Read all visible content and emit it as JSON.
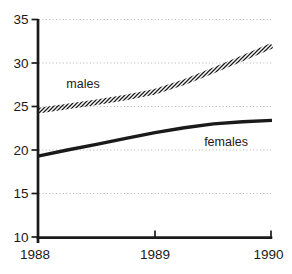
{
  "page": {
    "background": "#ffffff"
  },
  "chart_data": {
    "type": "line",
    "title": "",
    "xlabel": "",
    "ylabel": "",
    "xlim": [
      1988,
      1990
    ],
    "ylim": [
      10,
      35
    ],
    "grid": {
      "horizontal": true,
      "style": "dotted",
      "color": "#b2b2b2"
    },
    "axis_color": "#1a1a1a",
    "background": "#ffffff",
    "x_ticks": [
      {
        "value": 1988,
        "label": "1988"
      },
      {
        "value": 1989,
        "label": "1989"
      },
      {
        "value": 1990,
        "label": "1990"
      }
    ],
    "y_ticks": [
      {
        "value": 10,
        "label": "10"
      },
      {
        "value": 15,
        "label": "15"
      },
      {
        "value": 20,
        "label": "20"
      },
      {
        "value": 25,
        "label": "25"
      },
      {
        "value": 30,
        "label": "30"
      },
      {
        "value": 35,
        "label": "35"
      }
    ],
    "series": [
      {
        "name": "males",
        "label": "males",
        "style": "hatched-band",
        "color": "#1a1a1a",
        "label_anchor": {
          "year": 1988.385,
          "value": 27.1
        },
        "points": [
          [
            1988.0,
            24.5
          ],
          [
            1988.25,
            25.0
          ],
          [
            1988.5,
            25.5
          ],
          [
            1988.75,
            26.05
          ],
          [
            1989.0,
            26.7
          ],
          [
            1989.25,
            27.8
          ],
          [
            1989.5,
            29.15
          ],
          [
            1989.75,
            30.55
          ],
          [
            1990.0,
            32.0
          ]
        ],
        "key_values": {
          "1988": 24.5,
          "1989": 26.7,
          "1990": 32.0
        }
      },
      {
        "name": "females",
        "label": "females",
        "style": "solid-thick",
        "color": "#1a1a1a",
        "label_anchor": {
          "year": 1989.607,
          "value": 20.45
        },
        "points": [
          [
            1988.0,
            19.3
          ],
          [
            1988.25,
            20.0
          ],
          [
            1988.5,
            20.65
          ],
          [
            1988.75,
            21.35
          ],
          [
            1989.0,
            22.0
          ],
          [
            1989.25,
            22.55
          ],
          [
            1989.5,
            23.0
          ],
          [
            1989.75,
            23.25
          ],
          [
            1990.0,
            23.4
          ]
        ],
        "key_values": {
          "1988": 19.3,
          "1989": 22.0,
          "1990": 23.4
        }
      }
    ]
  }
}
